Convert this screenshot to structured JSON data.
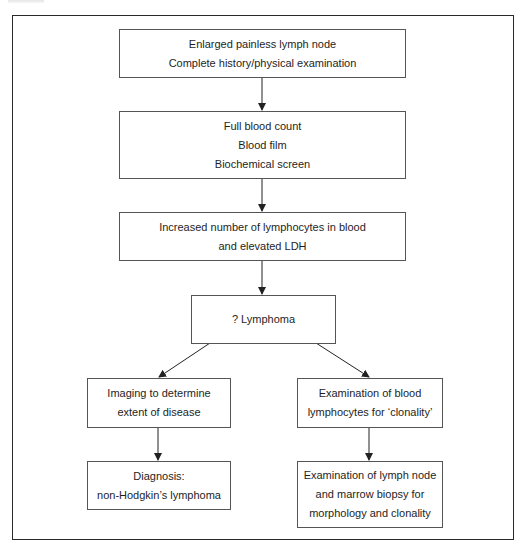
{
  "diagram": {
    "type": "flowchart",
    "nodes": [
      {
        "id": "n1",
        "lines": [
          "Enlarged painless lymph node",
          "Complete history/physical examination"
        ]
      },
      {
        "id": "n2",
        "lines": [
          "Full blood count",
          "Blood film",
          "Biochemical screen"
        ]
      },
      {
        "id": "n3",
        "lines": [
          "Increased number of lymphocytes in blood",
          "and elevated LDH"
        ]
      },
      {
        "id": "n4",
        "lines": [
          "? Lymphoma"
        ]
      },
      {
        "id": "n5",
        "lines": [
          "Imaging to determine",
          "extent of disease"
        ]
      },
      {
        "id": "n6",
        "lines": [
          "Diagnosis:",
          "non-Hodgkin’s lymphoma"
        ]
      },
      {
        "id": "n7",
        "lines": [
          "Examination of blood",
          "lymphocytes for ‘clonality’"
        ]
      },
      {
        "id": "n8",
        "lines": [
          "Examination of lymph node",
          "and marrow biopsy for",
          "morphology and clonality"
        ]
      }
    ],
    "edges": [
      {
        "from": "n1",
        "to": "n2"
      },
      {
        "from": "n2",
        "to": "n3"
      },
      {
        "from": "n3",
        "to": "n4"
      },
      {
        "from": "n4",
        "to": "n5"
      },
      {
        "from": "n4",
        "to": "n7"
      },
      {
        "from": "n5",
        "to": "n6"
      },
      {
        "from": "n7",
        "to": "n8"
      }
    ],
    "colors": {
      "frame": "#2a2a2a",
      "box_border": "#555555",
      "arrow": "#222222",
      "text": "#1e1e1e"
    }
  }
}
